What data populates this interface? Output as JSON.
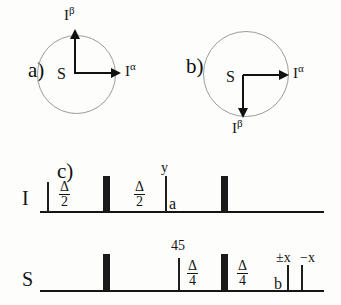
{
  "figure": {
    "panels": [
      {
        "id": "a",
        "letter": "a)",
        "origin_label": "S",
        "vectors": [
          {
            "name": "I-alpha",
            "base": "I",
            "sup": "α",
            "direction": "right"
          },
          {
            "name": "I-beta",
            "base": "I",
            "sup": "β",
            "direction": "up"
          }
        ]
      },
      {
        "id": "b",
        "letter": "b)",
        "origin_label": "S",
        "vectors": [
          {
            "name": "I-alpha",
            "base": "I",
            "sup": "α",
            "direction": "right"
          },
          {
            "name": "I-beta",
            "base": "I",
            "sup": "β",
            "direction": "down"
          }
        ]
      }
    ],
    "pulse_sequence": {
      "letter": "c)",
      "channels": [
        {
          "id": "I",
          "label": "I"
        },
        {
          "id": "S",
          "label": "S"
        }
      ],
      "delays": {
        "half": {
          "num": "Δ",
          "den": "2"
        },
        "quarter": {
          "num": "Δ",
          "den": "4"
        }
      },
      "annotations": {
        "phase_y": "y",
        "point_a": "a",
        "point_b": "b",
        "flip_45": "45",
        "phase_pm_x": "±x",
        "phase_minus_x": "−x"
      }
    }
  }
}
